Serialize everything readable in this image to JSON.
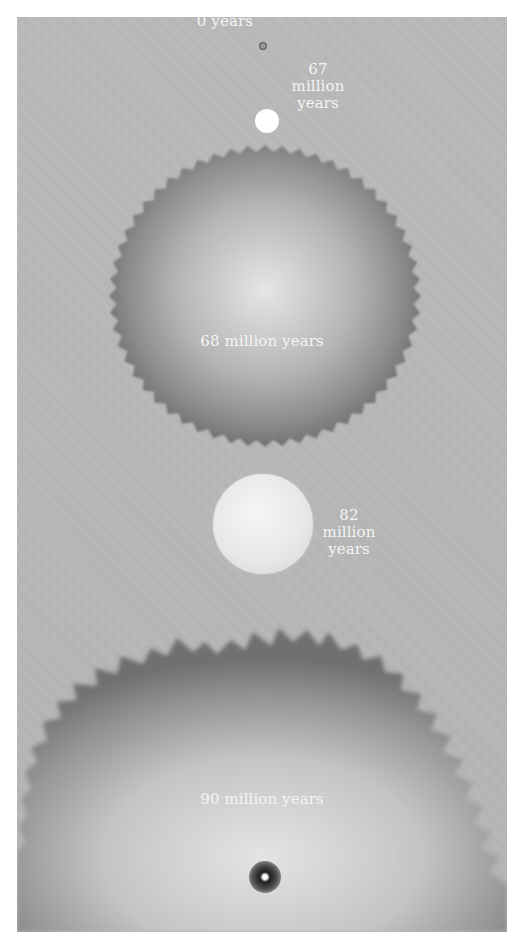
{
  "figure": {
    "stages": [
      {
        "id": "stage-0",
        "label": "0 years"
      },
      {
        "id": "stage-67",
        "label_lines": [
          "67",
          "million",
          "years"
        ]
      },
      {
        "id": "stage-68",
        "label": "68 million years"
      },
      {
        "id": "stage-82",
        "label_lines": [
          "82",
          "million",
          "years"
        ]
      },
      {
        "id": "stage-90",
        "label": "90 million years"
      }
    ]
  },
  "colors": {
    "background": "#b8b8b8",
    "bubble_edge": "#6e6e6e",
    "bubble_center": "#e2e2e2",
    "label_text": "#f4f4f4"
  }
}
